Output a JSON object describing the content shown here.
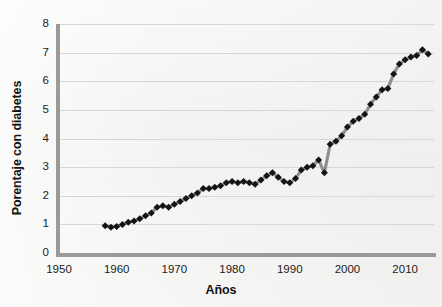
{
  "chart_data": {
    "type": "line",
    "title": "",
    "xlabel": "Años",
    "ylabel": "Porentaje con diabetes",
    "xlim": [
      1950,
      2015
    ],
    "ylim": [
      0,
      8
    ],
    "x_ticks": [
      "1950",
      "1960",
      "1970",
      "1980",
      "1990",
      "2000",
      "2010"
    ],
    "x_tick_values": [
      1950,
      1960,
      1970,
      1980,
      1990,
      2000,
      2010
    ],
    "y_ticks": [
      "0",
      "1",
      "2",
      "3",
      "4",
      "5",
      "6",
      "7",
      "8"
    ],
    "y_tick_values": [
      0,
      1,
      2,
      3,
      4,
      5,
      6,
      7,
      8
    ],
    "grid": "horizontal",
    "legend": "none",
    "marker": "diamond",
    "marker_color": "#141414",
    "line_color": "#8d8d8b",
    "series": [
      {
        "name": "Porentaje con diabetes",
        "x": [
          1958,
          1959,
          1960,
          1961,
          1962,
          1963,
          1964,
          1965,
          1966,
          1967,
          1968,
          1969,
          1970,
          1971,
          1972,
          1973,
          1974,
          1975,
          1976,
          1977,
          1978,
          1979,
          1980,
          1981,
          1982,
          1983,
          1984,
          1985,
          1986,
          1987,
          1988,
          1989,
          1990,
          1991,
          1992,
          1993,
          1994,
          1995,
          1996,
          1997,
          1998,
          1999,
          2000,
          2001,
          2002,
          2003,
          2004,
          2005,
          2006,
          2007,
          2008,
          2009,
          2010,
          2011,
          2012,
          2013,
          2014
        ],
        "values": [
          0.95,
          0.9,
          0.93,
          1.0,
          1.07,
          1.12,
          1.2,
          1.3,
          1.4,
          1.6,
          1.65,
          1.6,
          1.7,
          1.8,
          1.9,
          2.0,
          2.1,
          2.25,
          2.25,
          2.3,
          2.35,
          2.45,
          2.5,
          2.45,
          2.5,
          2.45,
          2.4,
          2.55,
          2.7,
          2.8,
          2.65,
          2.5,
          2.45,
          2.6,
          2.9,
          3.0,
          3.05,
          3.25,
          2.8,
          3.8,
          3.9,
          4.1,
          4.4,
          4.6,
          4.7,
          4.85,
          5.2,
          5.45,
          5.7,
          5.75,
          6.25,
          6.6,
          6.75,
          6.85,
          6.9,
          7.1,
          6.95
        ]
      }
    ]
  },
  "axes": {
    "y_title": "Porentaje con diabetes",
    "x_title": "Años"
  }
}
